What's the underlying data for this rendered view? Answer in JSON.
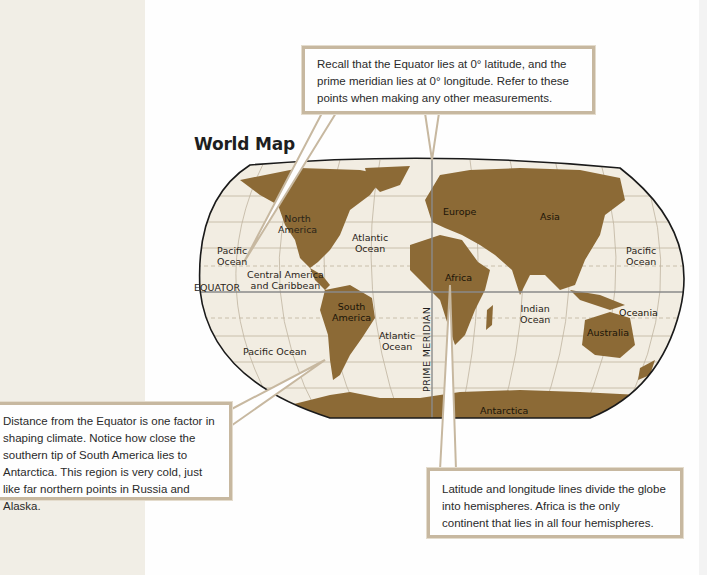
{
  "map": {
    "title": "World Map",
    "colors": {
      "land": "#8c6a36",
      "ocean": "#f2ede2",
      "grid": "#bfb49f",
      "equator_line": "#8a8a8a",
      "outline": "#1a1a1a",
      "callout_border": "#c7b8a0",
      "left_panel": "#f1eee6"
    },
    "labels": {
      "north_america": "North\nAmerica",
      "south_america": "South\nAmerica",
      "central_america": "Central America\nand Caribbean",
      "europe": "Europe",
      "asia": "Asia",
      "africa": "Africa",
      "australia": "Australia",
      "oceania": "Oceania",
      "antarctica": "Antarctica",
      "pacific_ocean_nw": "Pacific\nOcean",
      "pacific_ocean_sw": "Pacific Ocean",
      "pacific_ocean_e": "Pacific\nOcean",
      "atlantic_ocean_n": "Atlantic\nOcean",
      "atlantic_ocean_s": "Atlantic\nOcean",
      "indian_ocean": "Indian\nOcean",
      "equator": "EQUATOR",
      "prime_meridian": "PRIME MERIDIAN"
    }
  },
  "callouts": {
    "top": "Recall that the Equator lies at 0° latitude, and the prime meridian lies at 0° longitude. Refer to these points when making any other measurements.",
    "left": "Distance from the Equator is one factor in shaping climate. Notice how close the southern tip of South America lies to Antarctica. This region is very cold, just like far northern points in Russia and Alaska.",
    "bottom": "Latitude and longitude lines divide the globe into hemispheres. Africa is the only continent that lies in all four hemispheres."
  }
}
